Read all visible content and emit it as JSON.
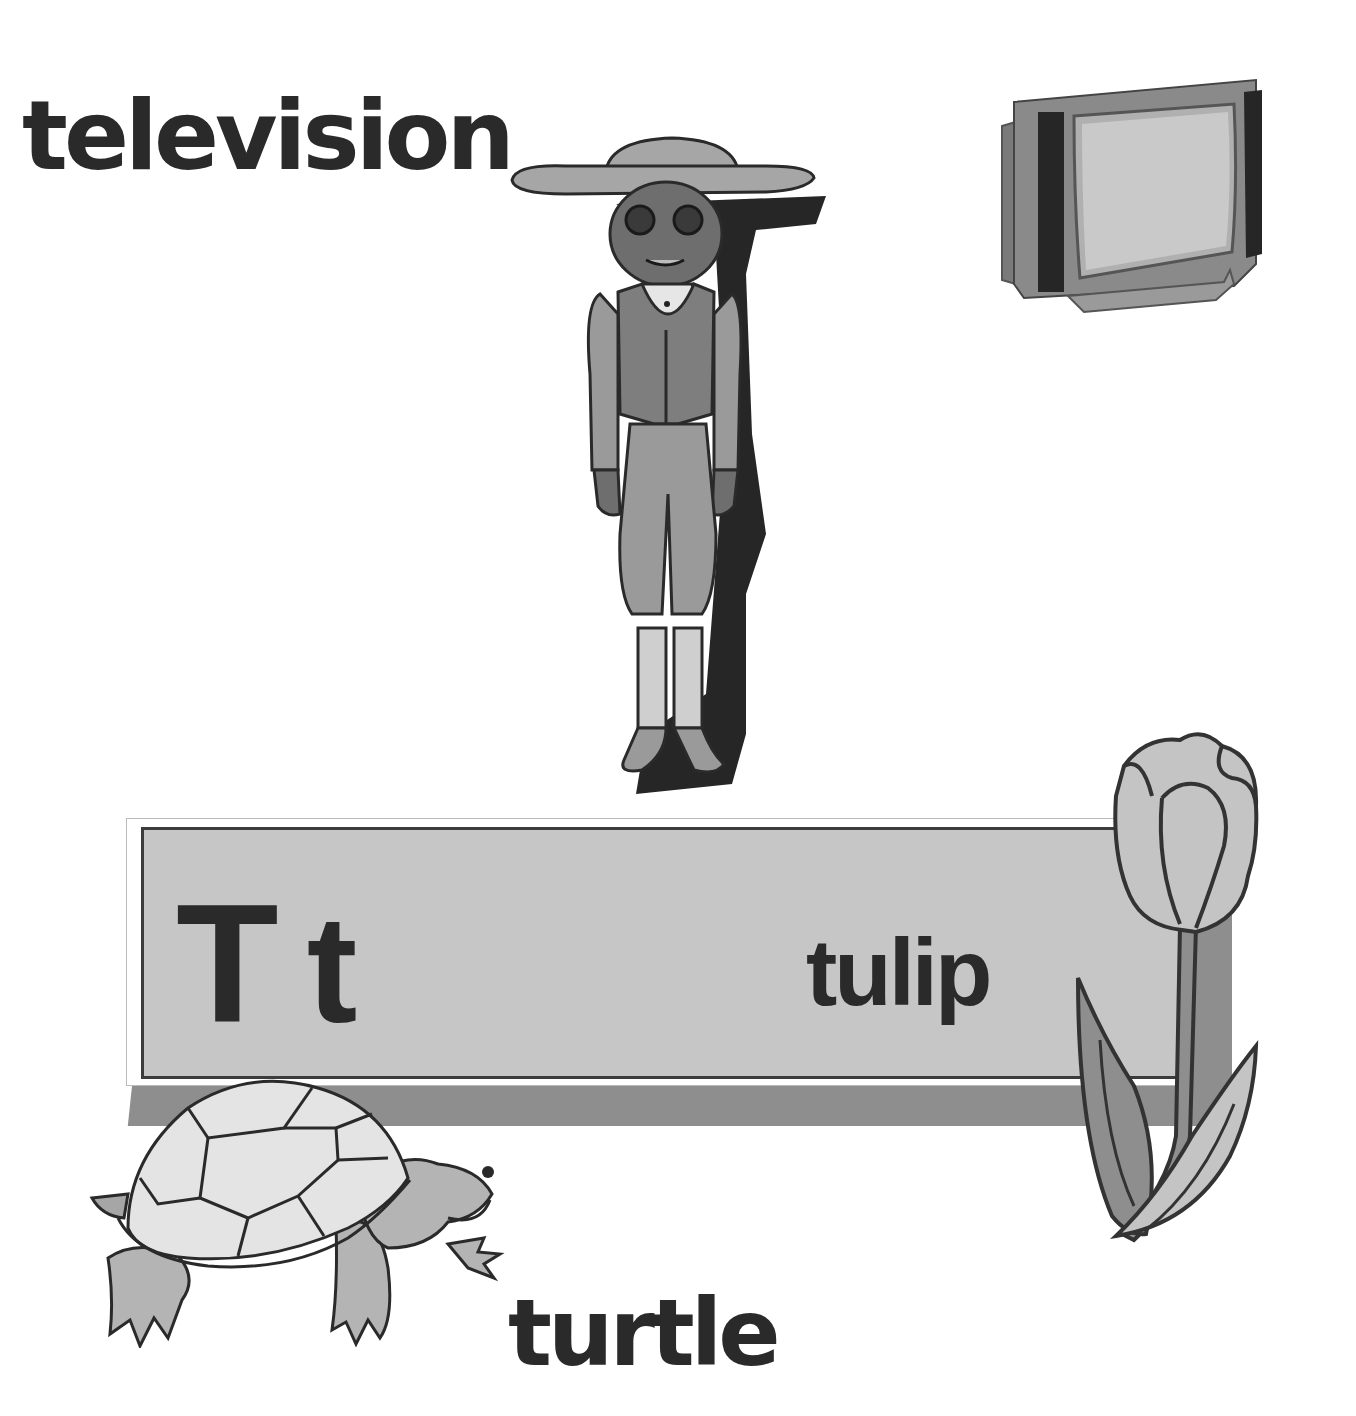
{
  "page": {
    "letter_upper": "T",
    "letter_lower": "t",
    "words": {
      "top_left": "television",
      "board": "tulip",
      "bottom": "turtle"
    },
    "illustrations": [
      {
        "name": "boy-with-hat",
        "description": "boy wearing wide-brim hat, glasses, vest and knickers"
      },
      {
        "name": "television",
        "description": "CRT television set"
      },
      {
        "name": "tulip",
        "description": "tulip flower with leaves"
      },
      {
        "name": "turtle",
        "description": "turtle walking"
      }
    ],
    "colors": {
      "text": "#2a2a2a",
      "board_fill": "#c6c6c6",
      "board_shadow": "#8e8e8e",
      "outline": "#3c3c3c",
      "background": "#ffffff"
    }
  }
}
